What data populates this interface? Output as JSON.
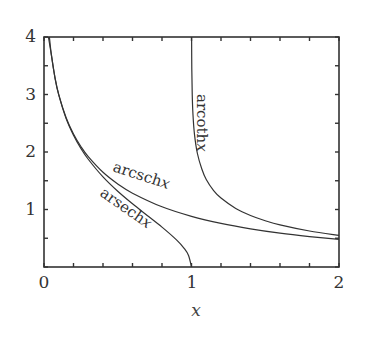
{
  "chart_data": {
    "type": "line",
    "title": "",
    "xlabel": "x",
    "ylabel": "",
    "xlim": [
      0,
      2
    ],
    "ylim": [
      0,
      4
    ],
    "grid": false,
    "legend": "none (curves labeled inline)",
    "x_ticks": {
      "labeled": [
        "0",
        "1",
        "2"
      ],
      "minor_step": 0.2
    },
    "y_ticks": {
      "labeled": [
        "1",
        "2",
        "3",
        "4"
      ],
      "minor_step": 0.5
    },
    "line_color": "#333333",
    "series": [
      {
        "name": "arsech x",
        "label_name": "arsech",
        "label_var": "x",
        "x": [
          0.03,
          0.05,
          0.075,
          0.1,
          0.15,
          0.2,
          0.25,
          0.3,
          0.4,
          0.5,
          0.6,
          0.7,
          0.8,
          0.9,
          0.95,
          0.98,
          1.0
        ],
        "y": [
          4.0,
          3.689,
          3.282,
          2.993,
          2.582,
          2.292,
          2.063,
          1.874,
          1.567,
          1.317,
          1.099,
          0.896,
          0.693,
          0.467,
          0.325,
          0.2,
          0.0
        ]
      },
      {
        "name": "arcsch x",
        "label_name": "arcsch",
        "label_var": "x",
        "x": [
          0.0366,
          0.05,
          0.075,
          0.1,
          0.15,
          0.2,
          0.25,
          0.3,
          0.4,
          0.5,
          0.6,
          0.8,
          1.0,
          1.2,
          1.4,
          1.6,
          1.8,
          2.0
        ],
        "y": [
          4.0,
          3.689,
          3.285,
          2.998,
          2.595,
          2.312,
          2.095,
          1.919,
          1.647,
          1.444,
          1.284,
          1.047,
          0.881,
          0.758,
          0.664,
          0.589,
          0.53,
          0.481
        ]
      },
      {
        "name": "arcoth x",
        "label_name": "arcoth",
        "label_var": "x",
        "x": [
          1.0007,
          1.002,
          1.005,
          1.01,
          1.02,
          1.04,
          1.07,
          1.1,
          1.15,
          1.2,
          1.3,
          1.4,
          1.5,
          1.6,
          1.8,
          2.0
        ],
        "y": [
          4.0,
          3.454,
          2.996,
          2.652,
          2.312,
          1.974,
          1.705,
          1.522,
          1.329,
          1.199,
          1.018,
          0.896,
          0.805,
          0.733,
          0.626,
          0.549
        ]
      }
    ]
  }
}
